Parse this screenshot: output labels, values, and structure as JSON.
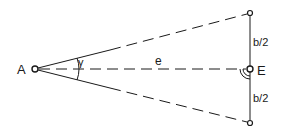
{
  "diagram": {
    "points": {
      "A": {
        "label": "A",
        "x": 35,
        "y": 69
      },
      "top": {
        "x": 250,
        "y": 13
      },
      "E": {
        "label": "E",
        "x": 250,
        "y": 69
      },
      "bottom": {
        "x": 250,
        "y": 123
      }
    },
    "labels": {
      "A": "A",
      "E": "E",
      "gamma": "γ",
      "e": "e",
      "half_b_top": "b/2",
      "half_b_bottom": "b/2"
    },
    "colors": {
      "stroke": "#1a1a1a",
      "background": "#ffffff"
    }
  }
}
